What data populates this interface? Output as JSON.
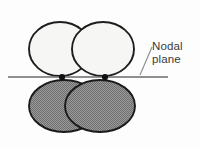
{
  "figure": {
    "kind": "orbital-nodal-plane-diagram",
    "background_color": "#fdfdfd",
    "annotation": {
      "label_line1": "Nodal",
      "label_line2": "plane",
      "text_color": "#3a3a3a"
    },
    "nodal_plane": {
      "name": "nodal-plane-line",
      "color": "#6a6a6a",
      "x_start": 8,
      "x_end": 168,
      "y": 77,
      "thickness": 1.4
    },
    "leader_line": {
      "color": "#8a8a8a",
      "x_start": 140,
      "y_start": 75,
      "x_end": 152,
      "y_end": 47,
      "thickness": 1.1
    },
    "nuclei": [
      {
        "label": "nucleus-left",
        "cx": 62,
        "cy": 77,
        "r": 3.1,
        "color": "#101010"
      },
      {
        "label": "nucleus-right",
        "cx": 105,
        "cy": 77,
        "r": 3.1,
        "color": "#101010"
      }
    ],
    "lobes": [
      {
        "label": "upper-left-lobe",
        "phase": "upper",
        "cx": 60,
        "cy": 49,
        "rx": 31,
        "ry": 27,
        "fill": "#f6f6f4",
        "stroke": "#1d1d1d",
        "stroke_width": 1.9,
        "shaded": false
      },
      {
        "label": "upper-right-lobe",
        "phase": "upper",
        "cx": 103,
        "cy": 49,
        "rx": 31,
        "ry": 27,
        "fill": "#f6f6f4",
        "stroke": "#1d1d1d",
        "stroke_width": 1.9,
        "shaded": false
      },
      {
        "label": "lower-left-lobe",
        "phase": "lower",
        "cx": 64,
        "cy": 106,
        "rx": 35,
        "ry": 26,
        "fill": "#8f8f8f",
        "stroke": "#1a1a1a",
        "stroke_width": 1.9,
        "shaded": true
      },
      {
        "label": "lower-right-lobe",
        "phase": "lower",
        "cx": 100,
        "cy": 106,
        "rx": 35,
        "ry": 26,
        "fill": "#8f8f8f",
        "stroke": "#1a1a1a",
        "stroke_width": 1.9,
        "shaded": true
      }
    ]
  }
}
